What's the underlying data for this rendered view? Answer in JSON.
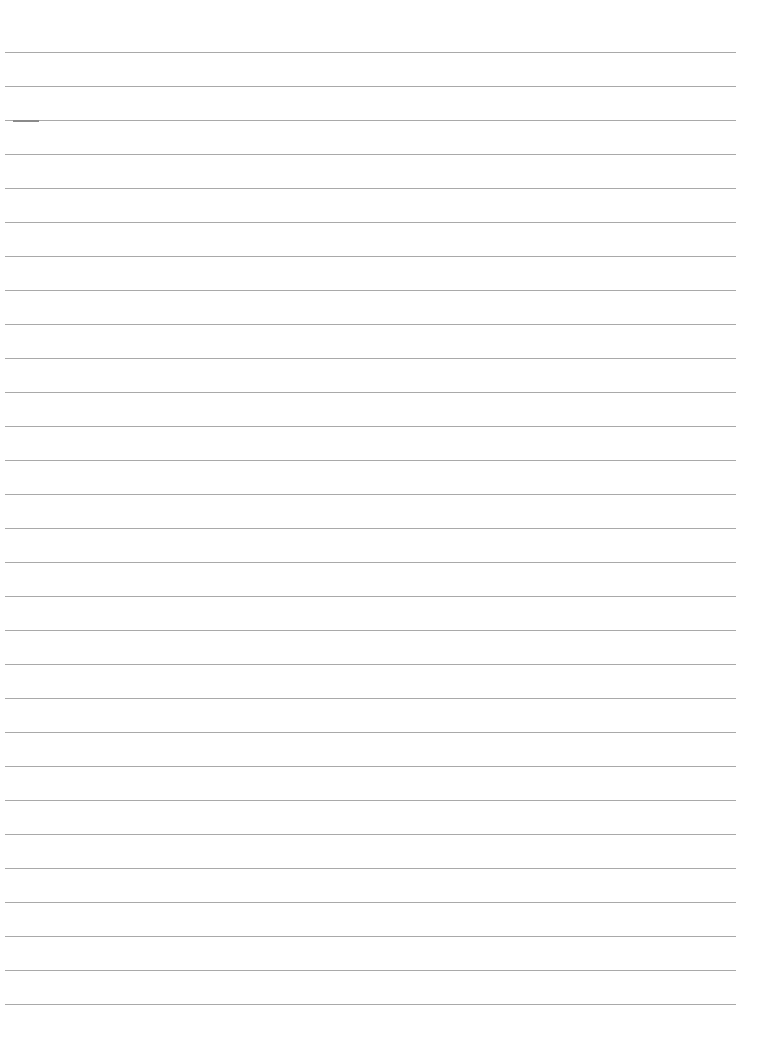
{
  "document": {
    "type": "ruled-paper",
    "line_count": 29,
    "line_color": "#a9a9a9",
    "background_color": "#ffffff",
    "text_content": []
  }
}
